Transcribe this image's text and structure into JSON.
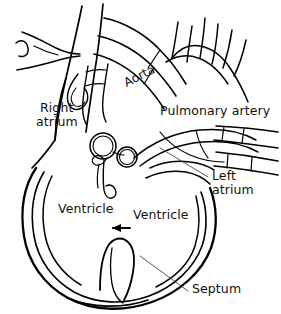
{
  "diagram": {
    "background_color": "#ffffff",
    "stroke_color": "#000000",
    "text_color": "#111111",
    "labels": [
      {
        "id": "aorta",
        "text": "Aorta",
        "x": 122,
        "y": 78,
        "rotation": -27
      },
      {
        "id": "right-atrium-l1",
        "text": "Right",
        "x": 40,
        "y": 108,
        "rotation": 0
      },
      {
        "id": "right-atrium-l2",
        "text": "atrium",
        "x": 36,
        "y": 122,
        "rotation": 0
      },
      {
        "id": "pulmonary-artery",
        "text": "Pulmonary  artery",
        "x": 160,
        "y": 110,
        "rotation": 0
      },
      {
        "id": "left-atrium-l1",
        "text": "Left",
        "x": 212,
        "y": 176,
        "rotation": 0
      },
      {
        "id": "left-atrium-l2",
        "text": "atrium",
        "x": 212,
        "y": 190,
        "rotation": 0
      },
      {
        "id": "ventricle-left",
        "text": "Ventricle",
        "x": 58,
        "y": 208,
        "rotation": 0
      },
      {
        "id": "ventricle-right",
        "text": "Ventricle",
        "x": 133,
        "y": 214,
        "rotation": 0
      },
      {
        "id": "septum",
        "text": "Septum",
        "x": 192,
        "y": 288,
        "rotation": 0
      }
    ],
    "leader_lines": [
      {
        "id": "left-atrium-leader",
        "from_x": 160,
        "from_y": 148,
        "to_x": 208,
        "to_y": 176
      },
      {
        "id": "septum-leader",
        "from_x": 140,
        "from_y": 256,
        "to_x": 188,
        "to_y": 291
      }
    ],
    "arrow": {
      "id": "ventricle-arrow",
      "from_x": 130,
      "from_y": 228,
      "to_x": 112,
      "to_y": 228,
      "direction": "left"
    }
  }
}
